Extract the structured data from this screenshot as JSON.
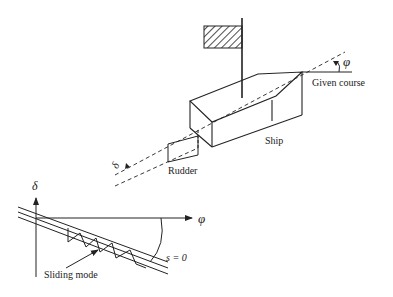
{
  "diagram": {
    "type": "ship course control with sliding mode",
    "labels": {
      "phi_top": "φ",
      "given_course": "Given course",
      "ship": "Ship",
      "delta_rudder": "δ",
      "rudder": "Rudder",
      "delta_axis": "δ",
      "phi_axis": "φ",
      "switching_surface": "s = 0",
      "sliding_mode": "Sliding mode"
    },
    "colors": {
      "stroke": "#222222",
      "background": "#ffffff"
    }
  }
}
